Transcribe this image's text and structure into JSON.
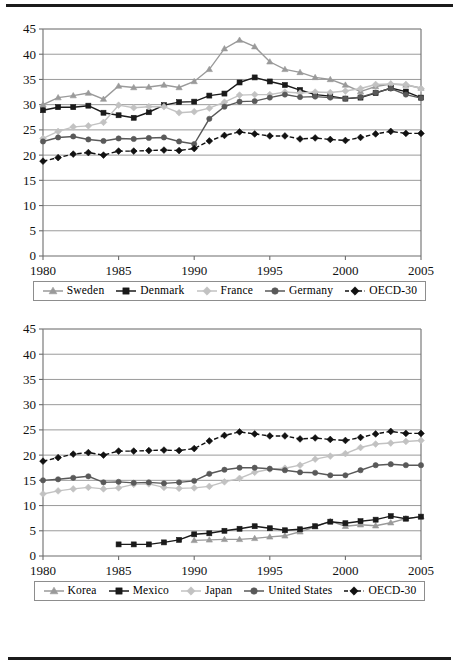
{
  "figure": {
    "panels": [
      {
        "id": "panel-top",
        "legend": [
          {
            "name": "Sweden",
            "marker": "triangle",
            "color": "#9a9a9a",
            "dashed": false
          },
          {
            "name": "Denmark",
            "marker": "square",
            "color": "#1a1a1a",
            "dashed": false
          },
          {
            "name": "France",
            "marker": "diamond",
            "color": "#c2c2c2",
            "dashed": false
          },
          {
            "name": "Germany",
            "marker": "circle",
            "color": "#595959",
            "dashed": false
          },
          {
            "name": "OECD-30",
            "marker": "diamond",
            "color": "#111111",
            "dashed": true
          }
        ]
      },
      {
        "id": "panel-bottom",
        "legend": [
          {
            "name": "Korea",
            "marker": "triangle",
            "color": "#9a9a9a",
            "dashed": false
          },
          {
            "name": "Mexico",
            "marker": "square",
            "color": "#1a1a1a",
            "dashed": false
          },
          {
            "name": "Japan",
            "marker": "diamond",
            "color": "#c2c2c2",
            "dashed": false
          },
          {
            "name": "United States",
            "marker": "circle",
            "color": "#595959",
            "dashed": false
          },
          {
            "name": "OECD-30",
            "marker": "diamond",
            "color": "#111111",
            "dashed": true
          }
        ]
      }
    ]
  },
  "chart_data": [
    {
      "type": "line",
      "id": "panel-top",
      "title": "",
      "xlabel": "",
      "ylabel": "",
      "x": [
        1980,
        1981,
        1982,
        1983,
        1984,
        1985,
        1986,
        1987,
        1988,
        1989,
        1990,
        1991,
        1992,
        1993,
        1994,
        1995,
        1996,
        1997,
        1998,
        1999,
        2000,
        2001,
        2002,
        2003,
        2004,
        2005
      ],
      "xlim": [
        1980,
        2005
      ],
      "ylim": [
        0,
        45
      ],
      "xticks": [
        1980,
        1985,
        1990,
        1995,
        2000,
        2005
      ],
      "yticks": [
        0,
        5,
        10,
        15,
        20,
        25,
        30,
        35,
        40,
        45
      ],
      "grid": "horizontal",
      "legend_position": "below",
      "series": [
        {
          "name": "Sweden",
          "marker": "triangle",
          "color": "#9a9a9a",
          "dashed": false,
          "values": [
            30.0,
            31.4,
            31.8,
            32.3,
            31.1,
            33.7,
            33.4,
            33.5,
            33.9,
            33.4,
            34.6,
            37.0,
            41.1,
            42.8,
            41.5,
            38.5,
            37.0,
            36.4,
            35.4,
            35.0,
            33.9,
            32.6,
            33.6,
            34.1,
            33.9,
            33.3
          ]
        },
        {
          "name": "Denmark",
          "marker": "square",
          "color": "#1a1a1a",
          "dashed": false,
          "values": [
            28.9,
            29.5,
            29.5,
            29.8,
            28.4,
            27.9,
            27.4,
            28.5,
            29.9,
            30.5,
            30.6,
            31.8,
            32.2,
            34.4,
            35.4,
            34.6,
            33.9,
            32.9,
            32.0,
            31.7,
            31.2,
            31.4,
            32.3,
            33.3,
            32.6,
            31.4
          ]
        },
        {
          "name": "France",
          "marker": "diamond",
          "color": "#c2c2c2",
          "dashed": false,
          "values": [
            23.3,
            24.7,
            25.6,
            25.8,
            26.5,
            29.9,
            29.4,
            29.6,
            29.6,
            28.4,
            28.6,
            29.3,
            30.5,
            31.9,
            32.0,
            32.0,
            32.5,
            32.3,
            32.5,
            32.4,
            32.7,
            33.2,
            34.0,
            34.1,
            34.0,
            33.2
          ]
        },
        {
          "name": "Germany",
          "marker": "circle",
          "color": "#595959",
          "dashed": false,
          "values": [
            22.7,
            23.5,
            23.7,
            23.1,
            22.8,
            23.3,
            23.2,
            23.4,
            23.5,
            22.7,
            22.2,
            27.2,
            29.6,
            30.6,
            30.7,
            31.4,
            32.0,
            31.5,
            31.6,
            31.4,
            31.2,
            31.5,
            32.4,
            33.2,
            32.0,
            31.3
          ]
        },
        {
          "name": "OECD-30",
          "marker": "diamond",
          "color": "#111111",
          "dashed": true,
          "values": [
            18.8,
            19.5,
            20.2,
            20.5,
            20.0,
            20.8,
            20.8,
            20.9,
            21.0,
            20.9,
            21.3,
            22.8,
            23.9,
            24.6,
            24.2,
            23.8,
            23.8,
            23.2,
            23.4,
            23.1,
            22.9,
            23.5,
            24.2,
            24.7,
            24.3,
            24.3
          ]
        }
      ]
    },
    {
      "type": "line",
      "id": "panel-bottom",
      "title": "",
      "xlabel": "",
      "ylabel": "",
      "x": [
        1980,
        1981,
        1982,
        1983,
        1984,
        1985,
        1986,
        1987,
        1988,
        1989,
        1990,
        1991,
        1992,
        1993,
        1994,
        1995,
        1996,
        1997,
        1998,
        1999,
        2000,
        2001,
        2002,
        2003,
        2004,
        2005
      ],
      "xlim": [
        1980,
        2005
      ],
      "ylim": [
        0,
        45
      ],
      "xticks": [
        1980,
        1985,
        1990,
        1995,
        2000,
        2005
      ],
      "yticks": [
        0,
        5,
        10,
        15,
        20,
        25,
        30,
        35,
        40,
        45
      ],
      "grid": "horizontal",
      "legend_position": "below",
      "series": [
        {
          "name": "Korea",
          "marker": "triangle",
          "color": "#9a9a9a",
          "dashed": false,
          "start_year": 1990,
          "values": [
            null,
            null,
            null,
            null,
            null,
            null,
            null,
            null,
            null,
            null,
            3.1,
            3.2,
            3.3,
            3.3,
            3.5,
            3.8,
            4.0,
            4.8,
            5.8,
            6.9,
            5.9,
            6.2,
            6.0,
            6.6,
            7.4,
            7.8
          ]
        },
        {
          "name": "Mexico",
          "marker": "square",
          "color": "#1a1a1a",
          "dashed": false,
          "start_year": 1985,
          "values": [
            null,
            null,
            null,
            null,
            null,
            2.3,
            2.3,
            2.3,
            2.7,
            3.2,
            4.3,
            4.5,
            5.0,
            5.4,
            5.9,
            5.5,
            5.1,
            5.3,
            5.9,
            6.8,
            6.5,
            6.9,
            7.2,
            7.9,
            7.4,
            7.8
          ]
        },
        {
          "name": "Japan",
          "marker": "diamond",
          "color": "#c2c2c2",
          "dashed": false,
          "values": [
            12.3,
            12.9,
            13.3,
            13.6,
            13.3,
            13.5,
            14.2,
            14.3,
            13.6,
            13.4,
            13.5,
            13.8,
            14.7,
            15.4,
            16.6,
            17.2,
            17.4,
            18.0,
            19.2,
            19.8,
            20.3,
            21.5,
            22.2,
            22.4,
            22.7,
            22.9
          ]
        },
        {
          "name": "United States",
          "marker": "circle",
          "color": "#595959",
          "dashed": false,
          "values": [
            15.0,
            15.2,
            15.5,
            15.8,
            14.6,
            14.7,
            14.5,
            14.6,
            14.4,
            14.6,
            14.9,
            16.3,
            17.1,
            17.5,
            17.5,
            17.3,
            17.0,
            16.6,
            16.5,
            16.0,
            16.0,
            17.0,
            18.0,
            18.2,
            18.0,
            18.0
          ]
        },
        {
          "name": "OECD-30",
          "marker": "diamond",
          "color": "#111111",
          "dashed": true,
          "values": [
            18.8,
            19.5,
            20.2,
            20.5,
            20.0,
            20.8,
            20.8,
            20.9,
            21.0,
            20.9,
            21.3,
            22.8,
            23.9,
            24.6,
            24.2,
            23.8,
            23.8,
            23.2,
            23.4,
            23.1,
            22.9,
            23.5,
            24.2,
            24.7,
            24.3,
            24.3
          ]
        }
      ]
    }
  ]
}
